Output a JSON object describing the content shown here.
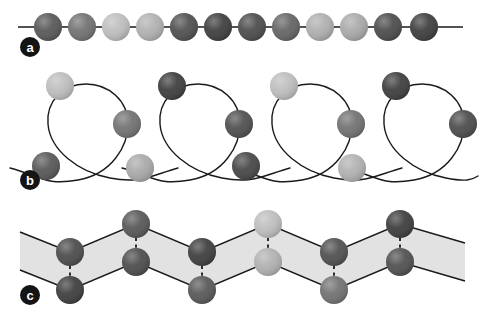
{
  "figure": {
    "width": 481,
    "height": 322,
    "background": "#ffffff",
    "palette": {
      "line": "#1a1a1a",
      "band_fill": "#e2e2e2",
      "band_stroke": "#1a1a1a",
      "label_badge": "#141414",
      "label_text": "#ffffff",
      "shade_darkest": "#3c3c3c",
      "shade_dark": "#4e4e4e",
      "shade_mid_dark": "#5e5e5e",
      "shade_mid": "#707070",
      "shade_light": "#a8a8a8",
      "shade_lightest": "#bdbdbd"
    }
  },
  "panels": [
    {
      "id": "a",
      "label": "a",
      "label_cx": 30,
      "label_cy": 47,
      "label_r": 10,
      "type": "linear-chain",
      "axis": {
        "y": 27,
        "x_start": 18,
        "x_end": 463
      },
      "sphere_radius": 14,
      "spheres": [
        {
          "cx": 48,
          "cy": 27,
          "color": "#565656"
        },
        {
          "cx": 82,
          "cy": 27,
          "color": "#707070"
        },
        {
          "cx": 116,
          "cy": 27,
          "color": "#bdbdbd"
        },
        {
          "cx": 150,
          "cy": 27,
          "color": "#b0b0b0"
        },
        {
          "cx": 184,
          "cy": 27,
          "color": "#4e4e4e"
        },
        {
          "cx": 218,
          "cy": 27,
          "color": "#3c3c3c"
        },
        {
          "cx": 252,
          "cy": 27,
          "color": "#4a4a4a"
        },
        {
          "cx": 286,
          "cy": 27,
          "color": "#636363"
        },
        {
          "cx": 320,
          "cy": 27,
          "color": "#aeaeae"
        },
        {
          "cx": 354,
          "cy": 27,
          "color": "#a8a8a8"
        },
        {
          "cx": 388,
          "cy": 27,
          "color": "#4a4a4a"
        },
        {
          "cx": 424,
          "cy": 27,
          "color": "#3c3c3c"
        }
      ]
    },
    {
      "id": "b",
      "label": "b",
      "label_cx": 30,
      "label_cy": 180,
      "label_r": 10,
      "type": "helix-coil",
      "sphere_radius": 14,
      "loops": [
        {
          "path": "M 10,168 C 40,176 46,186 78,180 C 112,174 128,146 128,124 C 128,100 108,84 86,84 C 62,84 46,102 48,124 C 50,150 78,172 110,178 C 140,184 150,176 178,168",
          "top_sphere": {
            "cx": 60,
            "cy": 86,
            "color": "#bdbdbd"
          },
          "right_sphere": {
            "cx": 127,
            "cy": 124,
            "color": "#707070"
          }
        },
        {
          "path": "M 122,168 C 152,176 158,186 190,180 C 224,174 240,146 240,124 C 240,100 220,84 198,84 C 174,84 158,102 160,124 C 162,150 190,172 222,178 C 252,184 262,176 290,168",
          "top_sphere": {
            "cx": 172,
            "cy": 86,
            "color": "#3c3c3c"
          },
          "right_sphere": {
            "cx": 239,
            "cy": 124,
            "color": "#4e4e4e"
          }
        },
        {
          "path": "M 234,168 C 264,176 270,186 302,180 C 336,174 352,146 352,124 C 352,100 332,84 310,84 C 286,84 270,102 272,124 C 274,150 302,172 334,178 C 364,184 374,176 402,168",
          "top_sphere": {
            "cx": 284,
            "cy": 86,
            "color": "#bdbdbd"
          },
          "right_sphere": {
            "cx": 351,
            "cy": 124,
            "color": "#707070"
          }
        },
        {
          "path": "M 346,168 C 376,176 382,186 414,180 C 448,174 464,146 464,124 C 464,100 444,84 422,84 C 398,84 382,102 384,124 C 386,150 414,172 446,178 C 466,182 472,180 478,176",
          "top_sphere": {
            "cx": 396,
            "cy": 86,
            "color": "#3c3c3c"
          },
          "right_sphere": {
            "cx": 463,
            "cy": 124,
            "color": "#4a4a4a"
          }
        }
      ],
      "bottom_spheres": [
        {
          "cx": 46,
          "cy": 166,
          "color": "#565656"
        },
        {
          "cx": 140,
          "cy": 168,
          "color": "#a8a8a8"
        },
        {
          "cx": 246,
          "cy": 166,
          "color": "#454545"
        },
        {
          "cx": 352,
          "cy": 168,
          "color": "#b0b0b0"
        }
      ]
    },
    {
      "id": "c",
      "label": "c",
      "label_cx": 30,
      "label_cy": 295,
      "label_r": 10,
      "type": "zigzag-ladder",
      "sphere_radius": 14,
      "band": "M 20,232 L 70,252 L 136,224 L 202,252 L 268,224 L 334,252 L 400,224 L 465,243 L 465,281 L 400,262 L 334,290 L 268,262 L 202,290 L 136,262 L 70,290 L 20,270 Z",
      "upper_chain": "M 20,232 L 70,252 L 136,224 L 202,252 L 268,224 L 334,252 L 400,224 L 465,243",
      "lower_chain": "M 20,270 L 70,290 L 136,262 L 202,290 L 268,262 L 334,290 L 400,262 L 465,281",
      "upper_spheres": [
        {
          "cx": 70,
          "cy": 252,
          "color": "#4a4a4a"
        },
        {
          "cx": 136,
          "cy": 224,
          "color": "#565656"
        },
        {
          "cx": 202,
          "cy": 252,
          "color": "#3c3c3c"
        },
        {
          "cx": 268,
          "cy": 224,
          "color": "#bdbdbd"
        },
        {
          "cx": 334,
          "cy": 252,
          "color": "#4e4e4e"
        },
        {
          "cx": 400,
          "cy": 224,
          "color": "#3c3c3c"
        }
      ],
      "lower_spheres": [
        {
          "cx": 70,
          "cy": 290,
          "color": "#3c3c3c"
        },
        {
          "cx": 136,
          "cy": 262,
          "color": "#4a4a4a"
        },
        {
          "cx": 202,
          "cy": 290,
          "color": "#565656"
        },
        {
          "cx": 268,
          "cy": 262,
          "color": "#b0b0b0"
        },
        {
          "cx": 334,
          "cy": 290,
          "color": "#707070"
        },
        {
          "cx": 400,
          "cy": 262,
          "color": "#4e4e4e"
        }
      ],
      "connectors": [
        {
          "x": 70,
          "y1": 252,
          "y2": 290
        },
        {
          "x": 136,
          "y1": 224,
          "y2": 262
        },
        {
          "x": 202,
          "y1": 252,
          "y2": 290
        },
        {
          "x": 268,
          "y1": 224,
          "y2": 262
        },
        {
          "x": 334,
          "y1": 252,
          "y2": 290
        },
        {
          "x": 400,
          "y1": 224,
          "y2": 262
        }
      ]
    }
  ]
}
